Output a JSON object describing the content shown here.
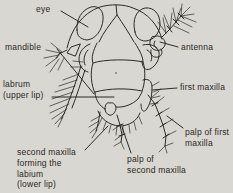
{
  "figure": {
    "type": "labeled-diagram",
    "background_color": "#d9d7d2",
    "ink_color": "#2e2b26",
    "eye_fill_color": "#191611",
    "label_color": "#2a2722",
    "labels": {
      "eye": {
        "text": "eye"
      },
      "antenna": {
        "text": "antenna"
      },
      "mandible": {
        "text": "mandible"
      },
      "labrum": {
        "lines": [
          "labrum",
          "(upper lip)"
        ]
      },
      "first_maxilla": {
        "text": "first maxilla"
      },
      "palp_of_first_maxilla": {
        "lines": [
          "palp of first",
          "maxilla"
        ]
      },
      "palp_of_second_maxilla": {
        "lines": [
          "palp of",
          "second maxilla"
        ]
      },
      "second_maxilla": {
        "lines": [
          "second maxilla",
          "forming the",
          "labium",
          "(lower lip)"
        ]
      }
    }
  }
}
